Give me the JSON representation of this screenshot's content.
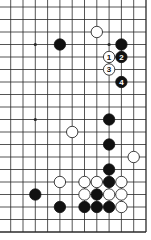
{
  "diagram": {
    "type": "go-board-fragment",
    "columns": 12,
    "rows": 19,
    "edges": {
      "right": true,
      "bottom": true,
      "top": false,
      "left": false
    },
    "colors": {
      "line": "#2a2a2a",
      "black": "#111111",
      "white": "#ffffff",
      "background": "#ffffff"
    },
    "star_points": [
      {
        "col": 2,
        "row": 3
      },
      {
        "col": 8,
        "row": 3
      },
      {
        "col": 2,
        "row": 9
      }
    ],
    "stones": [
      {
        "col": 7,
        "row": 2,
        "color": "white",
        "label": ""
      },
      {
        "col": 4,
        "row": 3,
        "color": "black",
        "label": ""
      },
      {
        "col": 9,
        "row": 3,
        "color": "black",
        "label": ""
      },
      {
        "col": 8,
        "row": 4,
        "color": "white",
        "label": "1"
      },
      {
        "col": 9,
        "row": 4,
        "color": "black",
        "label": "2"
      },
      {
        "col": 8,
        "row": 5,
        "color": "white",
        "label": "3"
      },
      {
        "col": 9,
        "row": 6,
        "color": "black",
        "label": "4"
      },
      {
        "col": 8,
        "row": 9,
        "color": "black",
        "label": ""
      },
      {
        "col": 5,
        "row": 10,
        "color": "white",
        "label": ""
      },
      {
        "col": 8,
        "row": 11,
        "color": "black",
        "label": ""
      },
      {
        "col": 10,
        "row": 12,
        "color": "white",
        "label": ""
      },
      {
        "col": 8,
        "row": 13,
        "color": "black",
        "label": ""
      },
      {
        "col": 4,
        "row": 14,
        "color": "white",
        "label": ""
      },
      {
        "col": 6,
        "row": 14,
        "color": "white",
        "label": ""
      },
      {
        "col": 7,
        "row": 14,
        "color": "white",
        "label": ""
      },
      {
        "col": 8,
        "row": 14,
        "color": "black",
        "label": ""
      },
      {
        "col": 9,
        "row": 14,
        "color": "white",
        "label": ""
      },
      {
        "col": 2,
        "row": 15,
        "color": "black",
        "label": ""
      },
      {
        "col": 6,
        "row": 15,
        "color": "white",
        "label": ""
      },
      {
        "col": 7,
        "row": 15,
        "color": "black",
        "label": ""
      },
      {
        "col": 8,
        "row": 15,
        "color": "white",
        "label": ""
      },
      {
        "col": 9,
        "row": 15,
        "color": "white",
        "label": ""
      },
      {
        "col": 4,
        "row": 16,
        "color": "black",
        "label": ""
      },
      {
        "col": 6,
        "row": 16,
        "color": "black",
        "label": ""
      },
      {
        "col": 7,
        "row": 16,
        "color": "black",
        "label": ""
      },
      {
        "col": 8,
        "row": 16,
        "color": "black",
        "label": ""
      },
      {
        "col": 9,
        "row": 16,
        "color": "white",
        "label": ""
      }
    ]
  }
}
